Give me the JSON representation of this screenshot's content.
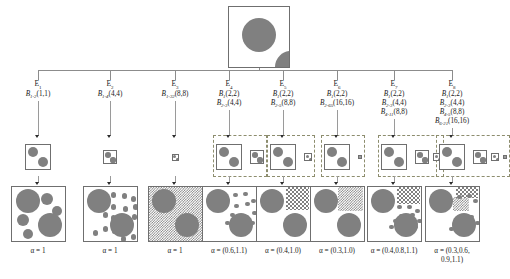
{
  "figure": {
    "colors": {
      "circle_fill": "#808080",
      "box_stroke": "#6f6f6f",
      "dashed_group_stroke": "#8d8d6e",
      "connector": "#8c8c8c",
      "arrow": "#2b2b2b",
      "background": "#ffffff"
    }
  },
  "root": {
    "name": "root-image",
    "circles": [
      {
        "cx": 30,
        "cy": 28,
        "r": 17
      },
      {
        "cx": 62,
        "cy": 60,
        "r": 16
      }
    ]
  },
  "branches": [
    {
      "id": "E1",
      "e_label": "E",
      "e_sub": "1",
      "b_lines": [
        {
          "sym": "B",
          "sub": "1-2",
          "args": "(1,1)"
        }
      ],
      "alpha": "α = 1",
      "alpha_lines": [
        "α = 1"
      ],
      "mid_group_dashed": false,
      "mid_boxes": [
        {
          "size": 26,
          "circles": [
            {
              "cx": 7,
              "cy": 7,
              "r": 5
            },
            {
              "cx": 17,
              "cy": 17,
              "r": 5
            }
          ]
        }
      ],
      "result": {
        "texture": "none",
        "texture_region": null,
        "circles": [
          {
            "cx": 16,
            "cy": 14,
            "r": 12
          },
          {
            "cx": 35,
            "cy": 12,
            "r": 6
          },
          {
            "cx": 45,
            "cy": 24,
            "r": 5
          },
          {
            "cx": 11,
            "cy": 33,
            "r": 6
          },
          {
            "cx": 38,
            "cy": 38,
            "r": 12
          },
          {
            "cx": 16,
            "cy": 47,
            "r": 5
          }
        ]
      }
    },
    {
      "id": "E2",
      "e_label": "E",
      "e_sub": "2",
      "b_lines": [
        {
          "sym": "B",
          "sub": "1-4",
          "args": "(4,4)"
        }
      ],
      "alpha": "α = 1",
      "alpha_lines": [
        "α = 1"
      ],
      "mid_group_dashed": false,
      "mid_boxes": [
        {
          "size": 14,
          "circles": [
            {
              "cx": 4,
              "cy": 4,
              "r": 2.8
            },
            {
              "cx": 9,
              "cy": 9,
              "r": 2.6
            }
          ]
        }
      ],
      "result": {
        "texture": "dots-medium",
        "texture_region": null,
        "circles": [
          {
            "cx": 15,
            "cy": 14,
            "r": 12
          },
          {
            "cx": 38,
            "cy": 38,
            "r": 12
          }
        ]
      }
    },
    {
      "id": "E3",
      "e_label": "E",
      "e_sub": "3",
      "b_lines": [
        {
          "sym": "B",
          "sub": "1-32",
          "args": "(8,8)"
        }
      ],
      "alpha": "α = 1",
      "alpha_lines": [
        "α = 1"
      ],
      "mid_group_dashed": false,
      "mid_boxes": [
        {
          "size": 7,
          "circles": [
            {
              "cx": 2,
              "cy": 2,
              "r": 1.5
            },
            {
              "cx": 5,
              "cy": 5,
              "r": 1.4
            }
          ]
        }
      ],
      "result": {
        "texture": "checker-small-full",
        "texture_region": "full",
        "circles": [
          {
            "cx": 15,
            "cy": 14,
            "r": 12
          },
          {
            "cx": 38,
            "cy": 38,
            "r": 12
          }
        ]
      }
    },
    {
      "id": "E4",
      "e_label": "E",
      "e_sub": "4",
      "b_lines": [
        {
          "sym": "B",
          "sub": "1",
          "args": "(2,2)"
        },
        {
          "sym": "B",
          "sub": "2-3",
          "args": "(4,4)"
        }
      ],
      "alpha": "α = (0.6,1.1)",
      "alpha_lines": [
        "α = (0.6,1.1)"
      ],
      "mid_group_dashed": true,
      "mid_boxes": [
        {
          "size": 26,
          "circles": [
            {
              "cx": 7,
              "cy": 7,
              "r": 5
            },
            {
              "cx": 17,
              "cy": 17,
              "r": 5
            }
          ]
        },
        {
          "size": 14,
          "circles": [
            {
              "cx": 4,
              "cy": 4,
              "r": 2.8
            },
            {
              "cx": 9,
              "cy": 9,
              "r": 2.6
            }
          ]
        }
      ],
      "result": {
        "texture": "dots-mixed",
        "texture_region": null,
        "circles": [
          {
            "cx": 15,
            "cy": 14,
            "r": 12
          },
          {
            "cx": 38,
            "cy": 38,
            "r": 12
          }
        ]
      }
    },
    {
      "id": "E5",
      "e_label": "E",
      "e_sub": "5",
      "b_lines": [
        {
          "sym": "B",
          "sub": "1",
          "args": "(2,2)"
        },
        {
          "sym": "B",
          "sub": "2-5",
          "args": "(8,8)"
        }
      ],
      "alpha": "α = (0.4,1.0)",
      "alpha_lines": [
        "α = (0.4,1.0)"
      ],
      "mid_group_dashed": true,
      "mid_boxes": [
        {
          "size": 26,
          "circles": [
            {
              "cx": 7,
              "cy": 7,
              "r": 5
            },
            {
              "cx": 17,
              "cy": 17,
              "r": 5
            }
          ]
        },
        {
          "size": 8,
          "circles": [
            {
              "cx": 2.4,
              "cy": 2.4,
              "r": 1.6
            },
            {
              "cx": 5.6,
              "cy": 5.6,
              "r": 1.5
            }
          ]
        }
      ],
      "result": {
        "texture": "checker-medium-corner",
        "texture_region": "upper-right",
        "circles": [
          {
            "cx": 15,
            "cy": 14,
            "r": 12
          },
          {
            "cx": 38,
            "cy": 38,
            "r": 12
          }
        ]
      }
    },
    {
      "id": "E6",
      "e_label": "E",
      "e_sub": "6",
      "b_lines": [
        {
          "sym": "B",
          "sub": "1",
          "args": "(2,2)"
        },
        {
          "sym": "B",
          "sub": "2-65",
          "args": "(16,16)"
        }
      ],
      "alpha": "α = (0.3,1.0)",
      "alpha_lines": [
        "α = (0.3,1.0)"
      ],
      "mid_group_dashed": true,
      "mid_boxes": [
        {
          "size": 26,
          "circles": [
            {
              "cx": 7,
              "cy": 7,
              "r": 5
            },
            {
              "cx": 17,
              "cy": 17,
              "r": 5
            }
          ]
        },
        {
          "size": 4,
          "circles": [
            {
              "cx": 1.2,
              "cy": 1.2,
              "r": 0.9
            },
            {
              "cx": 2.8,
              "cy": 2.8,
              "r": 0.8
            }
          ]
        }
      ],
      "result": {
        "texture": "checker-fine-corner",
        "texture_region": "upper-right",
        "circles": [
          {
            "cx": 15,
            "cy": 14,
            "r": 12
          },
          {
            "cx": 38,
            "cy": 38,
            "r": 12
          }
        ]
      }
    },
    {
      "id": "E7",
      "e_label": "E",
      "e_sub": "7",
      "b_lines": [
        {
          "sym": "B",
          "sub": "1",
          "args": "(2,2)"
        },
        {
          "sym": "B",
          "sub": "2-3",
          "args": "(4,4)"
        },
        {
          "sym": "B",
          "sub": "4-11",
          "args": "(8,8)"
        }
      ],
      "alpha": "α = (0.4,0.8,1.1)",
      "alpha_lines": [
        "α = (0.4,0.8,1.1)"
      ],
      "mid_group_dashed": true,
      "mid_boxes": [
        {
          "size": 26,
          "circles": [
            {
              "cx": 7,
              "cy": 7,
              "r": 5
            },
            {
              "cx": 17,
              "cy": 17,
              "r": 5
            }
          ]
        },
        {
          "size": 14,
          "circles": [
            {
              "cx": 4,
              "cy": 4,
              "r": 2.8
            },
            {
              "cx": 9,
              "cy": 9,
              "r": 2.6
            }
          ]
        },
        {
          "size": 8,
          "circles": [
            {
              "cx": 2.4,
              "cy": 2.4,
              "r": 1.6
            },
            {
              "cx": 5.6,
              "cy": 5.6,
              "r": 1.5
            }
          ]
        }
      ],
      "result": {
        "texture": "dots-and-checker",
        "texture_region": "upper-right",
        "circles": [
          {
            "cx": 15,
            "cy": 14,
            "r": 12
          },
          {
            "cx": 38,
            "cy": 38,
            "r": 12
          }
        ]
      }
    },
    {
      "id": "E8",
      "e_label": "E",
      "e_sub": "8",
      "b_lines": [
        {
          "sym": "B",
          "sub": "1",
          "args": "(2,2)"
        },
        {
          "sym": "B",
          "sub": "2-3",
          "args": "(4,4)"
        },
        {
          "sym": "B",
          "sub": "4-5",
          "args": "(8,8)"
        },
        {
          "sym": "B",
          "sub": "6-21",
          "args": "(16,16)"
        }
      ],
      "alpha": "α = (0.3,0.6,0.9,1.1)",
      "alpha_lines": [
        "α = (0.3,0.6,",
        "0.9,1.1)"
      ],
      "mid_group_dashed": true,
      "mid_boxes": [
        {
          "size": 26,
          "circles": [
            {
              "cx": 7,
              "cy": 7,
              "r": 5
            },
            {
              "cx": 17,
              "cy": 17,
              "r": 5
            }
          ]
        },
        {
          "size": 14,
          "circles": [
            {
              "cx": 4,
              "cy": 4,
              "r": 2.8
            },
            {
              "cx": 9,
              "cy": 9,
              "r": 2.6
            }
          ]
        },
        {
          "size": 8,
          "circles": [
            {
              "cx": 2.4,
              "cy": 2.4,
              "r": 1.6
            },
            {
              "cx": 5.6,
              "cy": 5.6,
              "r": 1.5
            }
          ]
        },
        {
          "size": 4,
          "circles": [
            {
              "cx": 1.2,
              "cy": 1.2,
              "r": 0.9
            },
            {
              "cx": 2.8,
              "cy": 2.8,
              "r": 0.8
            }
          ]
        }
      ],
      "result": {
        "texture": "dots-and-checker-fine",
        "texture_region": "upper-right",
        "circles": [
          {
            "cx": 15,
            "cy": 14,
            "r": 12
          },
          {
            "cx": 38,
            "cy": 38,
            "r": 12
          }
        ]
      }
    }
  ]
}
